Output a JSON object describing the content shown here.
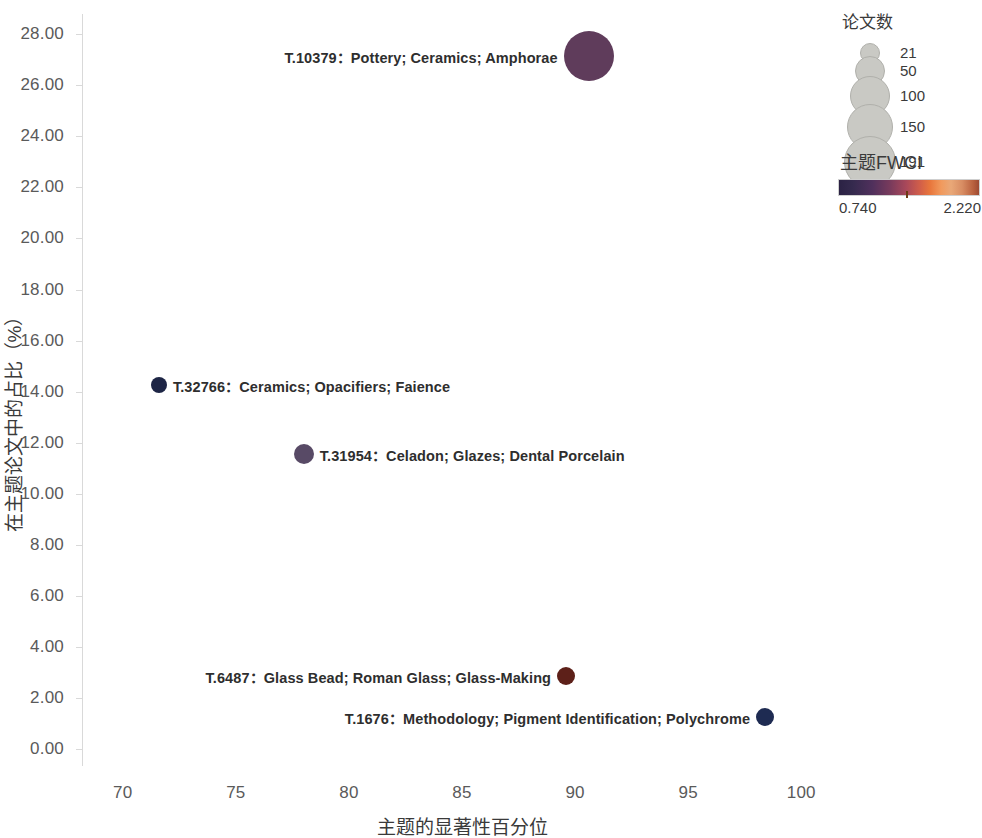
{
  "chart_data": {
    "type": "scatter",
    "title": "",
    "xlabel": "主题的显著性百分位",
    "ylabel": "在主题论文中的占比（%）",
    "xlim": [
      68.2,
      101.8
    ],
    "ylim": [
      -0.6,
      28.8
    ],
    "xticks": [
      "70",
      "75",
      "80",
      "85",
      "90",
      "95",
      "100"
    ],
    "xtick_values": [
      70,
      75,
      80,
      85,
      90,
      95,
      100
    ],
    "yticks": [
      "0.00",
      "2.00",
      "4.00",
      "6.00",
      "8.00",
      "10.00",
      "12.00",
      "14.00",
      "16.00",
      "18.00",
      "20.00",
      "22.00",
      "24.00",
      "26.00",
      "28.00"
    ],
    "ytick_values": [
      0,
      2,
      4,
      6,
      8,
      10,
      12,
      14,
      16,
      18,
      20,
      22,
      24,
      26,
      28
    ],
    "grid": false,
    "legend_position": "right",
    "size_encodes": "论文数",
    "color_encodes": "主题FWCI",
    "points": [
      {
        "label": "T.10379：Pottery; Ceramics; Amphorae",
        "topic_id": "T.10379",
        "keywords": "Pottery; Ceramics; Amphorae",
        "x": 90.6,
        "y": 27.15,
        "papers": 191,
        "fwci": 1.22,
        "color": "#5f3c5b",
        "radius_px": 25,
        "label_side": "left"
      },
      {
        "label": "T.32766：Ceramics; Opacifiers; Faience",
        "topic_id": "T.32766",
        "keywords": "Ceramics; Opacifiers; Faience",
        "x": 71.6,
        "y": 14.25,
        "papers": 24,
        "fwci": 0.77,
        "color": "#1d2545",
        "radius_px": 8,
        "label_side": "right"
      },
      {
        "label": "T.31954：Celadon; Glazes; Dental Porcelain",
        "topic_id": "T.31954",
        "keywords": "Celadon; Glazes; Dental Porcelain",
        "x": 78.0,
        "y": 11.55,
        "papers": 44,
        "fwci": 0.99,
        "color": "#584a66",
        "radius_px": 10,
        "label_side": "right"
      },
      {
        "label": "T.6487：Glass Bead; Roman Glass; Glass-Making",
        "topic_id": "T.6487",
        "keywords": "Glass Bead; Roman Glass; Glass-Making",
        "x": 89.6,
        "y": 2.85,
        "papers": 36,
        "fwci": 1.62,
        "color": "#5d2019",
        "radius_px": 9,
        "label_side": "left"
      },
      {
        "label": "T.1676：Methodology; Pigment Identification; Polychrome",
        "topic_id": "T.1676",
        "keywords": "Methodology; Pigment Identification; Polychrome",
        "x": 98.4,
        "y": 1.25,
        "papers": 40,
        "fwci": 0.8,
        "color": "#1e2b52",
        "radius_px": 9,
        "label_side": "left"
      }
    ]
  },
  "size_legend": {
    "title": "论文数",
    "items": [
      {
        "label": "21",
        "radius_px": 9
      },
      {
        "label": "50",
        "radius_px": 14
      },
      {
        "label": "100",
        "radius_px": 19
      },
      {
        "label": "150",
        "radius_px": 22
      },
      {
        "label": "191",
        "radius_px": 25
      }
    ]
  },
  "color_legend": {
    "title": "主题FWCI",
    "min_label": "0.740",
    "max_label": "2.220",
    "min_value": 0.74,
    "max_value": 2.22,
    "colormap": "rocket",
    "marker_position_pct": 48
  }
}
